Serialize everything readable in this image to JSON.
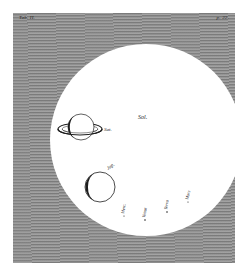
{
  "plate": {
    "top_left_label": "Tab. II.",
    "top_right_label": "p. 22.",
    "background_color": "#8a8a8a",
    "disc_color": "#ffffff",
    "ink_color": "#1e1e1e"
  },
  "sun": {
    "label": "Sol.",
    "center": [
      146,
      140
    ],
    "radius": 96
  },
  "planets": [
    {
      "name": "saturn",
      "label": "Sat.",
      "center": [
        80,
        127
      ],
      "radius": 13,
      "ring": true
    },
    {
      "name": "jupiter",
      "label": "Jup.",
      "center": [
        100,
        187
      ],
      "radius": 15,
      "ring": false
    }
  ],
  "small_planet_labels": [
    {
      "name": "mercury",
      "label": "Merc.",
      "x": 124,
      "y": 205
    },
    {
      "name": "venus",
      "label": "Venus",
      "x": 144,
      "y": 207
    },
    {
      "name": "earth",
      "label": "Terra",
      "x": 165,
      "y": 202
    },
    {
      "name": "mars",
      "label": "Mars",
      "x": 187,
      "y": 194
    }
  ]
}
